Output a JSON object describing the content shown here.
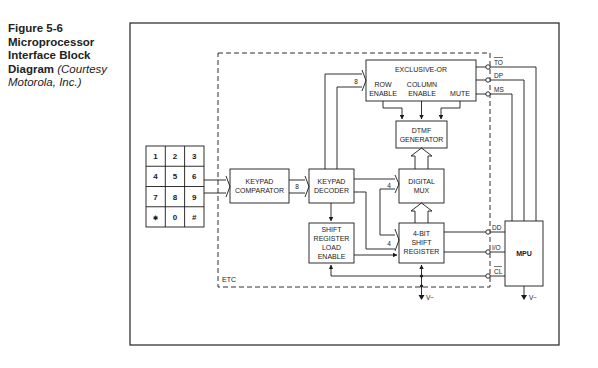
{
  "caption": {
    "figure_label": "Figure 5-6",
    "title": "Microprocessor Interface Block Diagram",
    "credit": "(Courtesy Motorola, Inc.)"
  },
  "diagram": {
    "container_label": "ETC",
    "keypad": {
      "keys": [
        "1",
        "2",
        "3",
        "4",
        "5",
        "6",
        "7",
        "8",
        "9",
        "✱",
        "0",
        "#"
      ]
    },
    "blocks": {
      "exclusive_or": {
        "title": "EXCLUSIVE-OR",
        "row_enable": [
          "ROW",
          "ENABLE"
        ],
        "column_enable": [
          "COLUMN",
          "ENABLE"
        ],
        "mute": "MUTE"
      },
      "dtmf_generator": [
        "DTMF",
        "GENERATOR"
      ],
      "keypad_comparator": [
        "KEYPAD",
        "COMPARATOR"
      ],
      "keypad_decoder": [
        "KEYPAD",
        "DECODER"
      ],
      "digital_mux": [
        "DIGITAL",
        "MUX"
      ],
      "shift_register_load_enable": [
        "SHIFT",
        "REGISTER",
        "LOAD",
        "ENABLE"
      ],
      "four_bit_shift_register": [
        "4-BIT",
        "SHIFT",
        "REGISTER"
      ],
      "mpu": "MPU"
    },
    "bus_widths": {
      "comparator_to_decoder": "8",
      "decoder_to_xor": "8",
      "decoder_to_mux": "4",
      "to_shift_register": "4"
    },
    "pins": {
      "to": "TO",
      "dp": "DP",
      "ms": "MS",
      "dd": "DD",
      "io": "I/O",
      "cl": "CL"
    },
    "supply": {
      "etc_ground": "V−",
      "mpu_ground": "V−"
    },
    "colors": {
      "line": "#1a1a1a",
      "frame": "#222222",
      "background": "#ffffff"
    }
  }
}
